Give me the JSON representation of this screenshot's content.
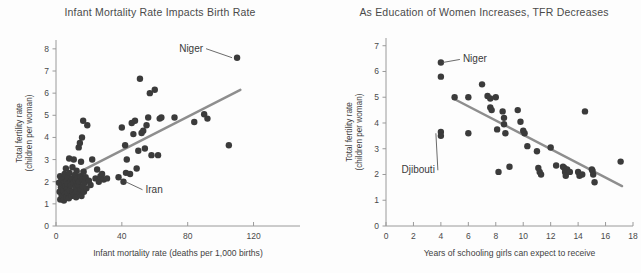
{
  "figure": {
    "background_color": "#fdfdfd",
    "dot_color": "#3b3b3b",
    "trend_color": "#8e8e8e",
    "axis_color": "#9a9a9a"
  },
  "chart_data": [
    {
      "type": "scatter",
      "panel": "left",
      "title": "Infant Mortality Rate Impacts Birth Rate",
      "xlabel": "Infant mortality rate (deaths per 1,000 births)",
      "ylabel": "Total fertility rate (children per woman)",
      "ylabel_line1": "Total fertility rate",
      "ylabel_line2": "(children per woman)",
      "xlim": [
        0,
        130
      ],
      "ylim": [
        0,
        8.4
      ],
      "xticks": [
        0,
        40,
        80,
        120
      ],
      "yticks": [
        0,
        1,
        2,
        3,
        4,
        5,
        6,
        7,
        8
      ],
      "grid": false,
      "legend": "none",
      "trend": {
        "x0": 4,
        "y0": 2.05,
        "x1": 112,
        "y1": 6.15
      },
      "annotations": [
        {
          "label": "Niger",
          "x": 110,
          "y": 7.6,
          "text_dx": -34,
          "text_dy": -6
        },
        {
          "label": "Iran",
          "x": 41,
          "y": 2.0,
          "text_dx": 22,
          "text_dy": 11
        }
      ],
      "points": [
        [
          1.8,
          1.95
        ],
        [
          2.2,
          1.55
        ],
        [
          2.5,
          2.25
        ],
        [
          2.6,
          1.2
        ],
        [
          3.0,
          1.75
        ],
        [
          3.2,
          2.05
        ],
        [
          3.4,
          1.4
        ],
        [
          3.8,
          1.9
        ],
        [
          4.0,
          1.35
        ],
        [
          4.2,
          2.1
        ],
        [
          4.5,
          1.6
        ],
        [
          4.8,
          1.15
        ],
        [
          5.0,
          1.95
        ],
        [
          5.2,
          2.35
        ],
        [
          5.5,
          1.45
        ],
        [
          5.8,
          1.8
        ],
        [
          6.0,
          2.6
        ],
        [
          6.2,
          1.3
        ],
        [
          6.5,
          2.0
        ],
        [
          6.8,
          1.7
        ],
        [
          7.0,
          1.5
        ],
        [
          7.2,
          2.2
        ],
        [
          7.5,
          1.9
        ],
        [
          7.8,
          1.25
        ],
        [
          8.0,
          3.05
        ],
        [
          8.2,
          2.4
        ],
        [
          8.5,
          1.6
        ],
        [
          8.8,
          2.0
        ],
        [
          9.0,
          1.85
        ],
        [
          9.4,
          1.35
        ],
        [
          9.8,
          2.15
        ],
        [
          10.0,
          2.65
        ],
        [
          10.2,
          1.55
        ],
        [
          10.5,
          1.95
        ],
        [
          10.8,
          3.0
        ],
        [
          11.0,
          1.4
        ],
        [
          11.5,
          2.3
        ],
        [
          11.8,
          1.75
        ],
        [
          12.0,
          2.05
        ],
        [
          12.2,
          1.3
        ],
        [
          12.5,
          2.5
        ],
        [
          12.8,
          1.6
        ],
        [
          13.0,
          2.15
        ],
        [
          13.4,
          1.85
        ],
        [
          13.8,
          3.55
        ],
        [
          14.0,
          2.0
        ],
        [
          14.2,
          1.5
        ],
        [
          14.5,
          3.75
        ],
        [
          14.8,
          2.25
        ],
        [
          15.0,
          1.65
        ],
        [
          15.2,
          2.9
        ],
        [
          15.5,
          1.35
        ],
        [
          15.8,
          4.0
        ],
        [
          16.0,
          2.1
        ],
        [
          16.2,
          1.8
        ],
        [
          16.5,
          4.75
        ],
        [
          16.8,
          2.45
        ],
        [
          17.0,
          1.55
        ],
        [
          17.5,
          1.95
        ],
        [
          18.0,
          2.2
        ],
        [
          18.5,
          1.7
        ],
        [
          19.0,
          4.55
        ],
        [
          20.0,
          2.05
        ],
        [
          21.0,
          1.85
        ],
        [
          22.0,
          3.0
        ],
        [
          24.0,
          2.15
        ],
        [
          25.0,
          2.55
        ],
        [
          26.0,
          2.0
        ],
        [
          27.0,
          2.25
        ],
        [
          28.0,
          2.35
        ],
        [
          29.0,
          2.1
        ],
        [
          31.0,
          2.15
        ],
        [
          38.0,
          2.2
        ],
        [
          40.0,
          4.45
        ],
        [
          41.0,
          2.0
        ],
        [
          42.0,
          3.65
        ],
        [
          42.5,
          2.4
        ],
        [
          43.0,
          3.0
        ],
        [
          45.0,
          2.35
        ],
        [
          46.0,
          4.65
        ],
        [
          47.0,
          4.15
        ],
        [
          48.0,
          4.75
        ],
        [
          49.0,
          2.6
        ],
        [
          50.0,
          3.4
        ],
        [
          51.0,
          6.65
        ],
        [
          52.0,
          4.2
        ],
        [
          53.0,
          4.3
        ],
        [
          54.0,
          3.5
        ],
        [
          55.0,
          4.55
        ],
        [
          56.0,
          4.9
        ],
        [
          57.0,
          6.0
        ],
        [
          58.0,
          3.2
        ],
        [
          60.0,
          6.15
        ],
        [
          62.0,
          3.2
        ],
        [
          63.0,
          4.85
        ],
        [
          64.0,
          4.9
        ],
        [
          72.0,
          4.9
        ],
        [
          84.0,
          4.7
        ],
        [
          90.0,
          5.05
        ],
        [
          92.0,
          4.85
        ],
        [
          105.0,
          3.65
        ],
        [
          110.0,
          7.6
        ]
      ]
    },
    {
      "type": "scatter",
      "panel": "right",
      "title": "As Education of Women Increases, TFR Decreases",
      "xlabel": "Years of schooling girls can expect to receive",
      "ylabel": "Total fertility rate (children per woman)",
      "ylabel_line1": "Total fertility rate",
      "ylabel_line2": "(children per woman)",
      "xlim": [
        0,
        18
      ],
      "ylim": [
        0,
        7.3
      ],
      "xticks": [
        0,
        2,
        4,
        6,
        8,
        10,
        12,
        14,
        16,
        18
      ],
      "yticks": [
        0,
        1,
        2,
        3,
        4,
        5,
        6,
        7
      ],
      "grid": false,
      "legend": "none",
      "trend": {
        "x0": 4.9,
        "y0": 4.95,
        "x1": 17.2,
        "y1": 1.55
      },
      "annotations": [
        {
          "label": "Niger",
          "x": 4.0,
          "y": 6.35,
          "text_dx": 22,
          "text_dy": 0
        },
        {
          "label": "Djibouti",
          "x": 4.0,
          "y": 3.6,
          "text_dx": -6,
          "text_dy": 40
        }
      ],
      "points": [
        [
          4.0,
          6.35
        ],
        [
          4.0,
          5.8
        ],
        [
          4.0,
          3.65
        ],
        [
          4.0,
          3.5
        ],
        [
          5.0,
          5.0
        ],
        [
          6.0,
          5.0
        ],
        [
          6.0,
          3.6
        ],
        [
          7.0,
          5.5
        ],
        [
          7.4,
          5.05
        ],
        [
          7.6,
          4.95
        ],
        [
          7.6,
          4.6
        ],
        [
          7.7,
          4.5
        ],
        [
          8.0,
          5.0
        ],
        [
          8.1,
          3.75
        ],
        [
          8.2,
          2.1
        ],
        [
          8.5,
          4.45
        ],
        [
          8.6,
          4.2
        ],
        [
          8.6,
          3.95
        ],
        [
          8.7,
          3.6
        ],
        [
          9.0,
          2.3
        ],
        [
          9.6,
          4.5
        ],
        [
          9.8,
          4.05
        ],
        [
          10.0,
          3.7
        ],
        [
          10.1,
          3.6
        ],
        [
          10.3,
          3.1
        ],
        [
          11.0,
          2.9
        ],
        [
          11.1,
          2.25
        ],
        [
          11.2,
          2.1
        ],
        [
          11.3,
          2.0
        ],
        [
          12.0,
          3.05
        ],
        [
          12.4,
          2.35
        ],
        [
          12.9,
          2.3
        ],
        [
          13.0,
          2.25
        ],
        [
          13.05,
          2.1
        ],
        [
          13.1,
          1.95
        ],
        [
          13.2,
          2.2
        ],
        [
          13.4,
          2.1
        ],
        [
          14.0,
          2.1
        ],
        [
          14.1,
          1.95
        ],
        [
          14.3,
          2.0
        ],
        [
          14.5,
          4.45
        ],
        [
          15.0,
          2.2
        ],
        [
          15.05,
          2.15
        ],
        [
          15.1,
          2.0
        ],
        [
          15.2,
          1.7
        ],
        [
          17.1,
          2.5
        ]
      ]
    }
  ]
}
